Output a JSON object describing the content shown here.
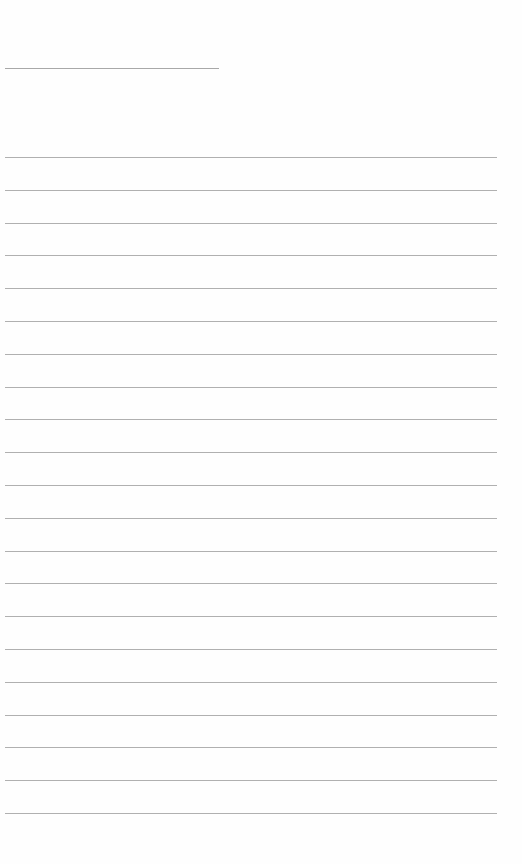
{
  "document": {
    "type": "blank lined page",
    "header_line": {
      "left": 5,
      "top": 68,
      "width": 214
    },
    "ruled_lines": {
      "count": 21,
      "left": 5,
      "first_top": 157,
      "spacing": 32.8,
      "width": 492
    },
    "colors": {
      "background": "#fefefe",
      "line": "#b0b0b0"
    }
  }
}
